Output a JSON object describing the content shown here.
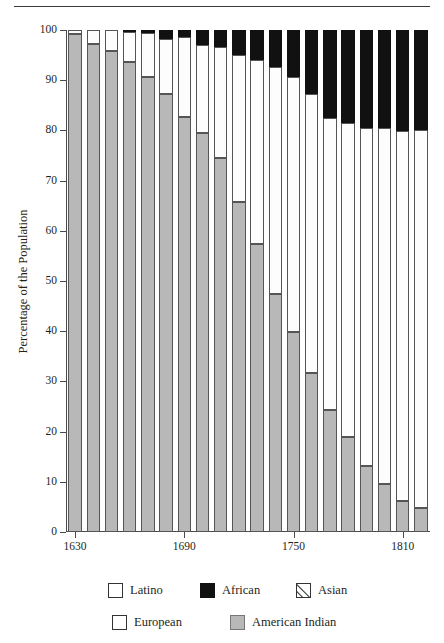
{
  "chart_data": {
    "type": "bar",
    "subtype": "stacked-bar-100-percent",
    "title": "",
    "xlabel": "",
    "ylabel": "Percentage of the Population",
    "ylim": [
      0,
      100
    ],
    "yticks": [
      0,
      10,
      20,
      30,
      40,
      50,
      60,
      70,
      80,
      90,
      100
    ],
    "ytick_labels": [
      "0",
      "10",
      "20",
      "30",
      "40",
      "50",
      "60",
      "70",
      "80",
      "90",
      "100"
    ],
    "xtick_labels": [
      "1630",
      "1690",
      "1750",
      "1810"
    ],
    "xtick_categories": [
      "1630",
      "1690",
      "1750",
      "1810"
    ],
    "grid": false,
    "legend_position": "bottom",
    "categories": [
      "1630",
      "1640",
      "1650",
      "1660",
      "1670",
      "1680",
      "1690",
      "1700",
      "1710",
      "1720",
      "1730",
      "1740",
      "1750",
      "1760",
      "1770",
      "1780",
      "1790",
      "1800",
      "1810",
      "1820"
    ],
    "series": [
      {
        "name": "American Indian",
        "color": "#b8b8b8",
        "values": [
          99.3,
          97.3,
          95.9,
          93.6,
          90.7,
          87.3,
          82.6,
          79.5,
          74.5,
          65.8,
          57.4,
          47.4,
          39.9,
          31.7,
          24.3,
          18.9,
          13.2,
          9.6,
          6.1,
          4.8
        ]
      },
      {
        "name": "European",
        "color": "#fdfdfd",
        "values": [
          0.7,
          2.7,
          4.1,
          6.0,
          8.7,
          10.9,
          16.1,
          17.5,
          22.2,
          29.2,
          36.6,
          45.3,
          50.7,
          55.5,
          58.2,
          62.6,
          67.3,
          70.8,
          73.7,
          75.2
        ]
      },
      {
        "name": "African",
        "color": "#111111",
        "values": [
          0.0,
          0.0,
          0.0,
          0.4,
          0.6,
          1.8,
          1.3,
          3.0,
          3.3,
          5.0,
          6.0,
          7.3,
          9.4,
          12.8,
          17.5,
          18.5,
          19.5,
          19.6,
          20.2,
          20.0
        ]
      }
    ],
    "legend": [
      {
        "label": "Latino",
        "swatch": "white-square",
        "color": "#ffffff"
      },
      {
        "label": "African",
        "swatch": "black-square",
        "color": "#111111"
      },
      {
        "label": "Asian",
        "swatch": "hatched-square",
        "color": "#ffffff"
      },
      {
        "label": "European",
        "swatch": "white-square",
        "color": "#ffffff"
      },
      {
        "label": "American Indian",
        "swatch": "gray-square",
        "color": "#b8b8b8"
      }
    ]
  }
}
